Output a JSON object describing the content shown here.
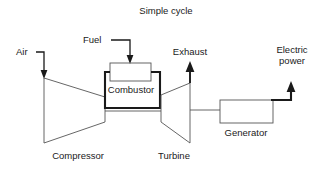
{
  "title": "Simple cycle",
  "diagram": {
    "type": "process-flow-diagram",
    "stroke_color": "#1a1a1a",
    "background_color": "#ffffff",
    "components": [
      {
        "id": "compressor",
        "label": "Compressor",
        "shape": "trapezoid-converging"
      },
      {
        "id": "combustor",
        "label": "Combustor",
        "shape": "rectangle-chamber"
      },
      {
        "id": "turbine",
        "label": "Turbine",
        "shape": "trapezoid-diverging"
      },
      {
        "id": "generator",
        "label": "Generator",
        "shape": "rectangle"
      }
    ],
    "flows": [
      {
        "id": "air-inlet",
        "label": "Air",
        "direction": "down-into-compressor"
      },
      {
        "id": "fuel-inlet",
        "label": "Fuel",
        "direction": "down-into-combustor"
      },
      {
        "id": "exhaust-outlet",
        "label": "Exhaust",
        "direction": "up-from-turbine"
      },
      {
        "id": "electric-power-outlet",
        "label": "Electric power",
        "label_line_1": "Electric",
        "label_line_2": "power",
        "direction": "up-from-generator"
      }
    ]
  },
  "labels": {
    "air": "Air",
    "fuel": "Fuel",
    "exhaust": "Exhaust",
    "electric_line1": "Electric",
    "electric_line2": "power",
    "compressor": "Compressor",
    "combustor": "Combustor",
    "turbine": "Turbine",
    "generator": "Generator"
  }
}
